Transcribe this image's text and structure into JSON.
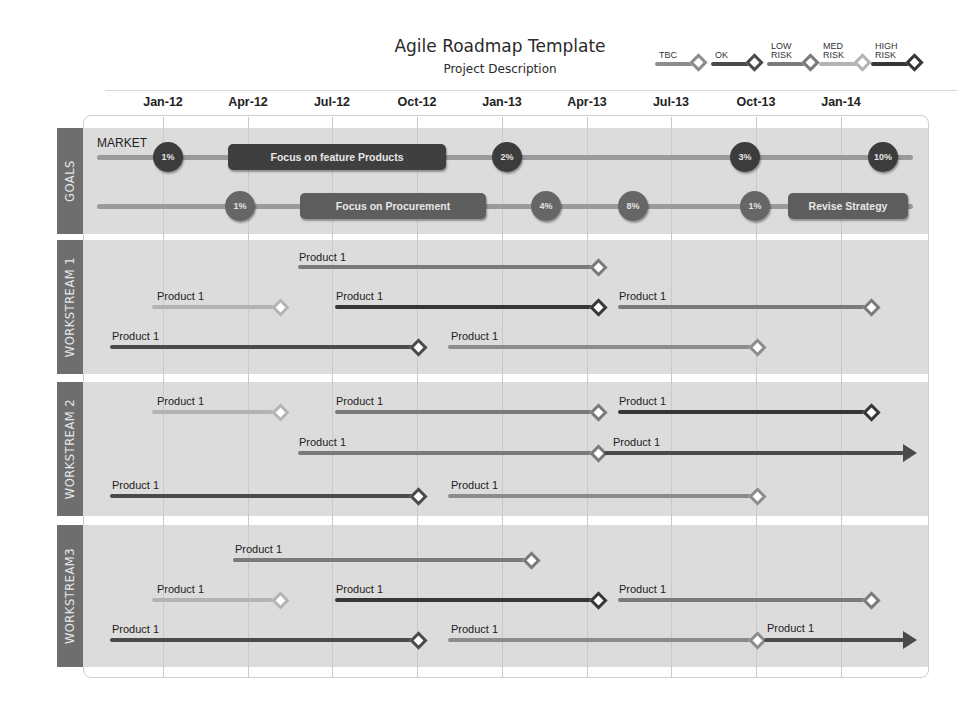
{
  "header": {
    "title": "Agile Roadmap Template",
    "subtitle": "Project Description"
  },
  "legend": [
    {
      "key": "tbc",
      "label": "TBC",
      "color": "#8c8c8c"
    },
    {
      "key": "ok",
      "label": "OK",
      "color": "#4a4a4a"
    },
    {
      "key": "low",
      "label": "LOW\nRISK",
      "color": "#7a7a7a"
    },
    {
      "key": "med",
      "label": "MED\nRISK",
      "color": "#b3b3b3"
    },
    {
      "key": "high",
      "label": "HIGH\nRISK",
      "color": "#363636"
    }
  ],
  "timeline": {
    "months": [
      "Jan-12",
      "Apr-12",
      "Jul-12",
      "Oct-12",
      "Jan-13",
      "Apr-13",
      "Jul-13",
      "Oct-13",
      "Jan-14"
    ]
  },
  "sections": [
    {
      "label": "GOALS"
    },
    {
      "label": "WORKSTREAM 1"
    },
    {
      "label": "WORKSTREAM 2"
    },
    {
      "label": "WORKSTREAM3"
    }
  ],
  "goals": {
    "market_label": "MARKET",
    "row1": {
      "milestones": [
        "1%",
        "2%",
        "3%",
        "10%"
      ],
      "pill": "Focus on feature Products"
    },
    "row2": {
      "milestones": [
        "1%",
        "4%",
        "8%",
        "1%"
      ],
      "pill": "Focus on Procurement",
      "pill2": "Revise Strategy"
    }
  },
  "workstreams": {
    "ws1": [
      "Product 1",
      "Product 1",
      "Product 1",
      "Product 1",
      "Product 1",
      "Product 1"
    ],
    "ws2": [
      "Product 1",
      "Product 1",
      "Product 1",
      "Product 1",
      "Product 1",
      "Product 1",
      "Product 1"
    ],
    "ws3": [
      "Product 1",
      "Product 1",
      "Product 1",
      "Product 1",
      "Product 1",
      "Product 1",
      "Product 1"
    ]
  },
  "colors": {
    "section_tab": "#6e6e6e",
    "section_body": "#dcdcdc",
    "goal_bubble": "#3c3c3c"
  }
}
